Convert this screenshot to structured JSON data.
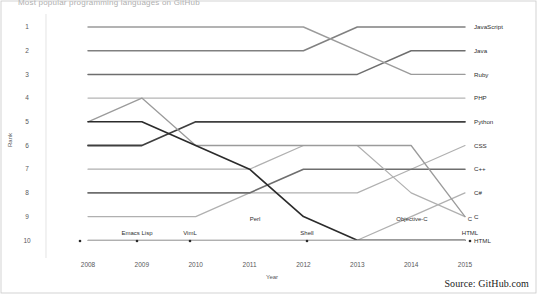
{
  "title": "Most popular programming languages on GitHub",
  "source_note": "Source: GitHub.com",
  "axes": {
    "x_title": "Year",
    "y_title": "Rank",
    "x_ticks": [
      "2008",
      "2009",
      "2010",
      "2011",
      "2012",
      "2013",
      "2014",
      "2015"
    ],
    "y_ticks": [
      "1",
      "2",
      "3",
      "4",
      "5",
      "6",
      "7",
      "8",
      "9",
      "10"
    ]
  },
  "inner_labels": [
    {
      "text": "Emacs Lisp",
      "x": 137,
      "y": 235
    },
    {
      "text": "VimL",
      "x": 190,
      "y": 235
    },
    {
      "text": "Perl",
      "x": 255,
      "y": 221
    },
    {
      "text": "Shell",
      "x": 307,
      "y": 235
    },
    {
      "text": "Objective-C",
      "x": 412,
      "y": 221
    },
    {
      "text": "C",
      "x": 470,
      "y": 221
    },
    {
      "text": "HTML",
      "x": 470,
      "y": 235
    }
  ],
  "markers": [
    {
      "x": 80,
      "y": 241
    },
    {
      "x": 137,
      "y": 241
    },
    {
      "x": 190,
      "y": 241
    },
    {
      "x": 307,
      "y": 241
    },
    {
      "x": 470,
      "y": 241
    }
  ],
  "chart_data": {
    "type": "line",
    "title": "Most popular programming languages on GitHub",
    "subtitle": "Rank by year, 2008-2015",
    "xlabel": "Year",
    "ylabel": "Rank",
    "x": [
      2008,
      2009,
      2010,
      2011,
      2012,
      2013,
      2014,
      2015
    ],
    "ylim": [
      10.5,
      0.5
    ],
    "y_inverted": true,
    "grid": false,
    "legend": "right-end-labels",
    "series": [
      {
        "name": "JavaScript",
        "color": "#808080",
        "width": 1.5,
        "values": [
          2,
          2,
          2,
          2,
          2,
          1,
          1,
          1
        ]
      },
      {
        "name": "Java",
        "color": "#6e6e6e",
        "width": 1.5,
        "values": [
          3,
          3,
          3,
          3,
          3,
          3,
          2,
          2
        ]
      },
      {
        "name": "Ruby",
        "color": "#9b9b9b",
        "width": 1.4,
        "values": [
          1,
          1,
          1,
          1,
          1,
          2,
          3,
          3
        ]
      },
      {
        "name": "PHP",
        "color": "#b5b5b5",
        "width": 1.2,
        "values": [
          4,
          4,
          4,
          4,
          4,
          4,
          4,
          4
        ]
      },
      {
        "name": "Python",
        "color": "#3f3f3f",
        "width": 1.8,
        "values": [
          6,
          6,
          5,
          5,
          5,
          5,
          5,
          5
        ]
      },
      {
        "name": "CSS",
        "color": "#b0b0b0",
        "width": 1.2,
        "values": [
          9,
          9,
          9,
          8,
          8,
          8,
          7,
          6
        ]
      },
      {
        "name": "C++",
        "color": "#6e6e6e",
        "width": 1.6,
        "values": [
          8,
          8,
          8,
          8,
          7,
          7,
          7,
          7
        ]
      },
      {
        "name": "C#",
        "color": "#b0b0b0",
        "width": 1.2,
        "values": [
          10,
          10,
          10,
          10,
          10,
          10,
          9,
          8
        ]
      },
      {
        "name": "Objective-C",
        "color": "#b0b0b0",
        "width": 1.2,
        "values": [
          7,
          7,
          7,
          7,
          6,
          6,
          8,
          9
        ]
      },
      {
        "name": "C",
        "color": "#9b9b9b",
        "width": 1.3,
        "values": [
          5,
          4,
          6,
          6,
          6,
          6,
          6,
          9
        ]
      },
      {
        "name": "Perl",
        "color": "#2b2b2b",
        "width": 1.6,
        "values": [
          5,
          5,
          6,
          7,
          9,
          10,
          10,
          10
        ]
      },
      {
        "name": "HTML",
        "color": "#b0b0b0",
        "width": 1.2,
        "values": [
          10,
          10,
          10,
          10,
          10,
          10,
          10,
          10
        ]
      }
    ],
    "end_labels": [
      "JavaScript",
      "Java",
      "Ruby",
      "PHP",
      "Python",
      "CSS",
      "C++",
      "C#",
      "C",
      "HTML"
    ],
    "annotations": [
      "Emacs Lisp",
      "VimL",
      "Perl",
      "Shell",
      "Objective-C",
      "C",
      "HTML"
    ]
  }
}
